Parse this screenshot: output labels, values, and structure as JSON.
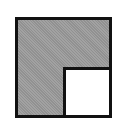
{
  "icon": {
    "name": "window-quadrant-icon",
    "colors": {
      "border": "#111111",
      "fill": "#9a9a9a",
      "inset": "#ffffff",
      "background": "#ffffff"
    }
  }
}
